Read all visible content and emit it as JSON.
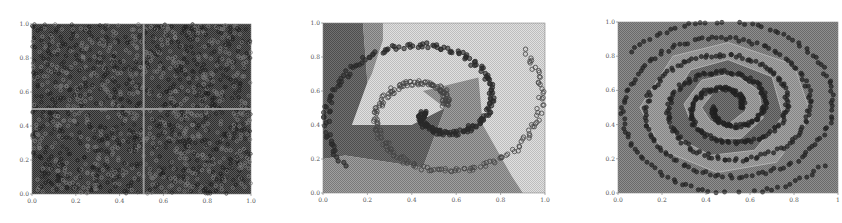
{
  "figure": {
    "panels": [
      {
        "id": "checkerboard",
        "description": "Four-quadrant (2x2 checkerboard) classification, dense scatter",
        "frame": {
          "x": 32,
          "y": 24,
          "w": 219,
          "h": 170
        },
        "xticks": [
          "0.0",
          "0.2",
          "0.4",
          "0.6",
          "0.8",
          "1.0"
        ],
        "yticks": [
          "0.0",
          "0.2",
          "0.4",
          "0.6",
          "0.8",
          "1.0"
        ],
        "colors": {
          "background": "#4a4a4a",
          "region_alt": "#3a3a3a",
          "boundary": "#9a9a9a",
          "marker": "#222222",
          "marker_light": "#8a8a8a"
        }
      },
      {
        "id": "two-spirals",
        "description": "Two interleaved spirals with decision regions",
        "frame": {
          "x": 323,
          "y": 23,
          "w": 222,
          "h": 170
        },
        "xticks": [
          "0.0",
          "0.2",
          "0.4",
          "0.6",
          "0.8",
          "1.0"
        ],
        "yticks": [
          "0.0",
          "0.2",
          "0.4",
          "0.6",
          "0.8",
          "1.0"
        ],
        "colors": {
          "light": "#cfcfcf",
          "medium": "#8c8c8c",
          "dark": "#5e5e5e",
          "marker": "#2a2a2a",
          "marker_open": "#555555"
        }
      },
      {
        "id": "multi-spiral",
        "description": "Multi-arm concentric spiral with decision regions",
        "frame": {
          "x": 618,
          "y": 22,
          "w": 220,
          "h": 171
        },
        "xticks": [
          "0.0",
          "0.2",
          "0.4",
          "0.6",
          "0.8",
          "1"
        ],
        "yticks": [
          "0.0",
          "0.2",
          "0.4",
          "0.6",
          "0.8",
          "1.0"
        ],
        "colors": {
          "background": "#7a7a7a",
          "region_light": "#9a9a9a",
          "region_dark": "#656565",
          "boundary": "#bdbdbd",
          "marker": "#262626"
        }
      }
    ]
  },
  "chart_data": [
    {
      "type": "scatter",
      "title": "",
      "xlabel": "",
      "ylabel": "",
      "xlim": [
        0.0,
        1.0
      ],
      "ylim": [
        0.0,
        1.0
      ],
      "xticks": [
        0.0,
        0.2,
        0.4,
        0.6,
        0.8,
        1.0
      ],
      "yticks": [
        0.0,
        0.2,
        0.4,
        0.6,
        0.8,
        1.0
      ],
      "grid": false,
      "legend": null,
      "series": [
        {
          "name": "class A (quadrants x<0.5,y>0.5 and x>0.5,y<0.5)",
          "pattern": "uniform random dense"
        },
        {
          "name": "class B (quadrants x<0.5,y<0.5 and x>0.5,y>0.5)",
          "pattern": "uniform random dense"
        }
      ],
      "decision_boundaries": [
        {
          "x": 0.5
        },
        {
          "y": 0.5
        }
      ]
    },
    {
      "type": "scatter",
      "title": "",
      "xlabel": "",
      "ylabel": "",
      "xlim": [
        0.0,
        1.0
      ],
      "ylim": [
        0.0,
        1.0
      ],
      "xticks": [
        0.0,
        0.2,
        0.4,
        0.6,
        0.8,
        1.0
      ],
      "yticks": [
        0.0,
        0.2,
        0.4,
        0.6,
        0.8,
        1.0
      ],
      "grid": false,
      "legend": null,
      "series": [
        {
          "name": "spiral 1 (open circles)",
          "center": [
            0.5,
            0.5
          ],
          "turns": 1.0,
          "start_angle_deg": 180,
          "r_max": 0.5
        },
        {
          "name": "spiral 2 (filled dark)",
          "center": [
            0.5,
            0.5
          ],
          "turns": 1.0,
          "start_angle_deg": 0,
          "r_max": 0.5
        }
      ],
      "regions": [
        "light",
        "medium",
        "dark"
      ]
    },
    {
      "type": "scatter",
      "title": "",
      "xlabel": "",
      "ylabel": "",
      "xlim": [
        0.0,
        1.0
      ],
      "ylim": [
        0.0,
        1.0
      ],
      "xticks": [
        0.0,
        0.2,
        0.4,
        0.6,
        0.8,
        1.0
      ],
      "yticks": [
        0.0,
        0.2,
        0.4,
        0.6,
        0.8,
        1.0
      ],
      "grid": false,
      "legend": null,
      "series": [
        {
          "name": "spiral arm 1",
          "center": [
            0.5,
            0.5
          ],
          "turns": 2.5,
          "r_max": 0.55
        },
        {
          "name": "spiral arm 2",
          "center": [
            0.5,
            0.5
          ],
          "turns": 2.5,
          "r_max": 0.55
        }
      ],
      "regions": [
        "light",
        "medium",
        "dark"
      ]
    }
  ]
}
